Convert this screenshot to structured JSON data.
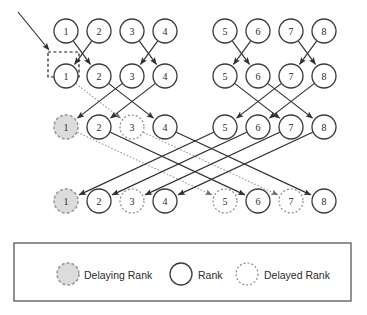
{
  "figure": {
    "colors": {
      "solid_edge": "#2f2f2f",
      "dotted_edge": "#9a9a9a",
      "node_stroke": "#3a3a3a",
      "delaying_fill": "#dcdcdc",
      "delaying_stroke": "#9a9a9a",
      "delayed_stroke": "#8a8a8a",
      "focus_box_stroke": "#1d1d1d",
      "legend_border": "#4a4a4a",
      "background": "#ffffff"
    }
  },
  "rows": [
    {
      "id": "row-1",
      "y": 31,
      "nodes": [
        {
          "label": "1",
          "x": 66,
          "state": "rank"
        },
        {
          "label": "2",
          "x": 99,
          "state": "rank"
        },
        {
          "label": "3",
          "x": 132,
          "state": "rank"
        },
        {
          "label": "4",
          "x": 165,
          "state": "rank"
        },
        {
          "label": "5",
          "x": 225,
          "state": "rank"
        },
        {
          "label": "6",
          "x": 258,
          "state": "rank"
        },
        {
          "label": "7",
          "x": 291,
          "state": "rank"
        },
        {
          "label": "8",
          "x": 324,
          "state": "rank"
        }
      ]
    },
    {
      "id": "row-2",
      "y": 76,
      "nodes": [
        {
          "label": "1",
          "x": 66,
          "state": "rank"
        },
        {
          "label": "2",
          "x": 99,
          "state": "rank"
        },
        {
          "label": "3",
          "x": 132,
          "state": "rank"
        },
        {
          "label": "4",
          "x": 165,
          "state": "rank"
        },
        {
          "label": "5",
          "x": 225,
          "state": "rank"
        },
        {
          "label": "6",
          "x": 258,
          "state": "rank"
        },
        {
          "label": "7",
          "x": 291,
          "state": "rank"
        },
        {
          "label": "8",
          "x": 324,
          "state": "rank"
        }
      ]
    },
    {
      "id": "row-3",
      "y": 127,
      "nodes": [
        {
          "label": "1",
          "x": 66,
          "state": "delaying"
        },
        {
          "label": "2",
          "x": 99,
          "state": "rank"
        },
        {
          "label": "3",
          "x": 132,
          "state": "delayed"
        },
        {
          "label": "4",
          "x": 165,
          "state": "rank"
        },
        {
          "label": "5",
          "x": 225,
          "state": "rank"
        },
        {
          "label": "6",
          "x": 258,
          "state": "rank"
        },
        {
          "label": "7",
          "x": 291,
          "state": "rank"
        },
        {
          "label": "8",
          "x": 324,
          "state": "rank"
        }
      ]
    },
    {
      "id": "row-4",
      "y": 201,
      "nodes": [
        {
          "label": "1",
          "x": 66,
          "state": "delaying"
        },
        {
          "label": "2",
          "x": 99,
          "state": "rank"
        },
        {
          "label": "3",
          "x": 132,
          "state": "delayed"
        },
        {
          "label": "4",
          "x": 165,
          "state": "rank"
        },
        {
          "label": "5",
          "x": 225,
          "state": "delayed"
        },
        {
          "label": "6",
          "x": 258,
          "state": "rank"
        },
        {
          "label": "7",
          "x": 291,
          "state": "delayed"
        },
        {
          "label": "8",
          "x": 324,
          "state": "rank"
        }
      ]
    }
  ],
  "node_radius": 12,
  "edges": [
    {
      "from_row": 0,
      "from_index": 0,
      "to_row": 1,
      "to_index": 1,
      "style": "solid"
    },
    {
      "from_row": 0,
      "from_index": 1,
      "to_row": 1,
      "to_index": 0,
      "style": "solid"
    },
    {
      "from_row": 0,
      "from_index": 2,
      "to_row": 1,
      "to_index": 3,
      "style": "solid"
    },
    {
      "from_row": 0,
      "from_index": 3,
      "to_row": 1,
      "to_index": 2,
      "style": "solid"
    },
    {
      "from_row": 0,
      "from_index": 4,
      "to_row": 1,
      "to_index": 5,
      "style": "solid"
    },
    {
      "from_row": 0,
      "from_index": 5,
      "to_row": 1,
      "to_index": 4,
      "style": "solid"
    },
    {
      "from_row": 0,
      "from_index": 6,
      "to_row": 1,
      "to_index": 7,
      "style": "solid"
    },
    {
      "from_row": 0,
      "from_index": 7,
      "to_row": 1,
      "to_index": 6,
      "style": "solid"
    },
    {
      "from_row": 1,
      "from_index": 0,
      "to_row": 2,
      "to_index": 2,
      "style": "dotted"
    },
    {
      "from_row": 1,
      "from_index": 1,
      "to_row": 2,
      "to_index": 3,
      "style": "solid"
    },
    {
      "from_row": 1,
      "from_index": 2,
      "to_row": 2,
      "to_index": 0,
      "style": "solid"
    },
    {
      "from_row": 1,
      "from_index": 3,
      "to_row": 2,
      "to_index": 1,
      "style": "solid"
    },
    {
      "from_row": 1,
      "from_index": 4,
      "to_row": 2,
      "to_index": 6,
      "style": "solid"
    },
    {
      "from_row": 1,
      "from_index": 5,
      "to_row": 2,
      "to_index": 7,
      "style": "solid"
    },
    {
      "from_row": 1,
      "from_index": 6,
      "to_row": 2,
      "to_index": 4,
      "style": "solid"
    },
    {
      "from_row": 1,
      "from_index": 7,
      "to_row": 2,
      "to_index": 5,
      "style": "solid"
    },
    {
      "from_row": 2,
      "from_index": 0,
      "to_row": 3,
      "to_index": 4,
      "style": "dotted"
    },
    {
      "from_row": 2,
      "from_index": 1,
      "to_row": 3,
      "to_index": 5,
      "style": "solid"
    },
    {
      "from_row": 2,
      "from_index": 2,
      "to_row": 3,
      "to_index": 6,
      "style": "dotted"
    },
    {
      "from_row": 2,
      "from_index": 3,
      "to_row": 3,
      "to_index": 7,
      "style": "solid"
    },
    {
      "from_row": 2,
      "from_index": 4,
      "to_row": 3,
      "to_index": 0,
      "style": "solid"
    },
    {
      "from_row": 2,
      "from_index": 5,
      "to_row": 3,
      "to_index": 1,
      "style": "solid"
    },
    {
      "from_row": 2,
      "from_index": 6,
      "to_row": 3,
      "to_index": 2,
      "style": "solid"
    },
    {
      "from_row": 2,
      "from_index": 7,
      "to_row": 3,
      "to_index": 3,
      "style": "solid"
    }
  ],
  "focus_box": {
    "x": 48,
    "y": 52,
    "width": 31,
    "height": 25
  },
  "incoming_arrow": {
    "x1": 18,
    "y1": 12,
    "x2": 49,
    "y2": 50
  },
  "legend": {
    "box": {
      "x": 14,
      "y": 243,
      "width": 337,
      "height": 58
    },
    "items": [
      {
        "key": "delaying",
        "symbol": "delaying-rank-circle",
        "label": "Delaying Rank",
        "symbol_x": 68,
        "label_x": 84
      },
      {
        "key": "rank",
        "symbol": "rank-circle",
        "label": "Rank",
        "symbol_x": 181,
        "label_x": 198
      },
      {
        "key": "delayed",
        "symbol": "delayed-rank-circle",
        "label": "Delayed Rank",
        "symbol_x": 247,
        "label_x": 264
      }
    ],
    "symbol_y": 274,
    "symbol_radius": 11
  }
}
